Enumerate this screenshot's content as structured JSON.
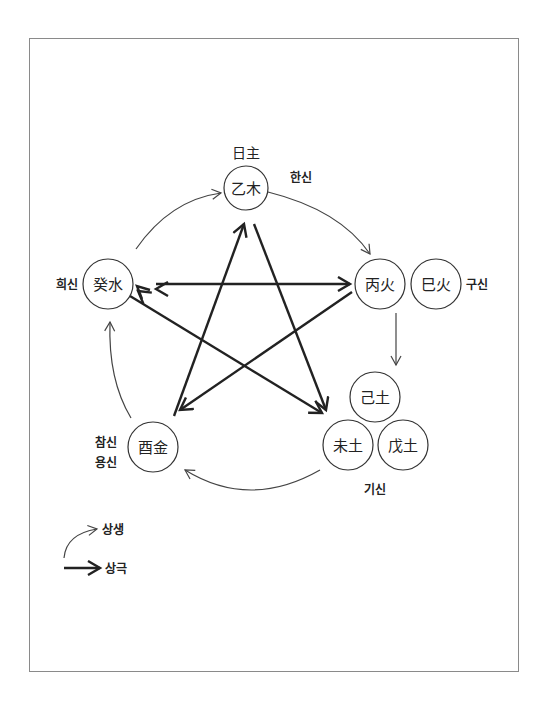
{
  "diagram": {
    "title_label": "日主",
    "nodes": {
      "eul_mok": "乙木",
      "gye_su": "癸水",
      "byeong_hwa": "丙火",
      "sa_hwa": "巳火",
      "gi_to": "己土",
      "mi_to": "未土",
      "mu_to": "戊土",
      "yu_geum": "酉金"
    },
    "role_labels": {
      "han_sin": "한신",
      "gu_sin": "구신",
      "hui_sin": "희신",
      "gi_sin": "기신",
      "cham_sin": "참신",
      "yong_sin": "용신"
    },
    "generating_cycle": [
      "乙木 → 丙火",
      "丙火 → 己土",
      "未土 → 酉金",
      "酉金 → 癸水",
      "癸水 → 乙木"
    ],
    "controlling_cycle": [
      "乙木 → 未土",
      "未土 ← 癸水",
      "癸水 → 丙火",
      "丙火 → 酉金",
      "酉金 → 乙木"
    ],
    "colors": {
      "line": "#222222",
      "thin_line": "#444444",
      "frame": "#8a8a8a"
    }
  },
  "legend": {
    "generating_label": "상생",
    "controlling_label": "상극"
  }
}
